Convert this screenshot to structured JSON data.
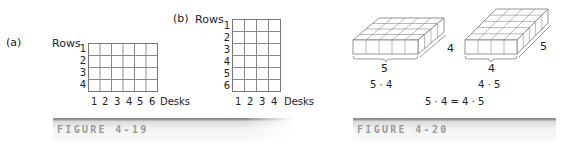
{
  "figure_4_19": {
    "caption": "FIGURE 4-19",
    "panel_a": {
      "label": "(a)",
      "y_axis_label": "Rows",
      "x_axis_label": "Desks",
      "rows": 4,
      "cols": 6,
      "row_ticks": [
        "1",
        "2",
        "3",
        "4"
      ],
      "col_ticks": [
        "1",
        "2",
        "3",
        "4",
        "5",
        "6"
      ]
    },
    "panel_b": {
      "label": "(b)",
      "y_axis_label": "Rows",
      "x_axis_label": "Desks",
      "rows": 6,
      "cols": 4,
      "row_ticks": [
        "1",
        "2",
        "3",
        "4",
        "5",
        "6"
      ],
      "col_ticks": [
        "1",
        "2",
        "3",
        "4"
      ]
    }
  },
  "figure_4_20": {
    "caption": "FIGURE 4-20",
    "left_block": {
      "front": "5",
      "depth": "4",
      "product": "5 · 4"
    },
    "right_block": {
      "front": "4",
      "depth": "5",
      "product": "4 · 5"
    },
    "equation": "5 · 4 = 4 · 5"
  },
  "colors": {
    "grid_line": "#888888",
    "caption": "#9a9a9a",
    "bar": "#8a8a8a"
  }
}
